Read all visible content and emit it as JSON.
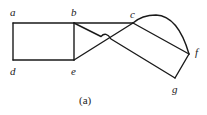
{
  "diagram": {
    "caption": "(a)",
    "nodes": [
      {
        "id": "a",
        "label": "a",
        "x": 13,
        "y": 23
      },
      {
        "id": "b",
        "label": "b",
        "x": 74,
        "y": 23
      },
      {
        "id": "c",
        "label": "c",
        "x": 133,
        "y": 23
      },
      {
        "id": "d",
        "label": "d",
        "x": 13,
        "y": 60
      },
      {
        "id": "e",
        "label": "e",
        "x": 74,
        "y": 60
      },
      {
        "id": "f",
        "label": "f",
        "x": 189,
        "y": 54
      },
      {
        "id": "g",
        "label": "g",
        "x": 175,
        "y": 78
      }
    ],
    "edges": [
      {
        "from": "a",
        "to": "b",
        "type": "line"
      },
      {
        "from": "a",
        "to": "d",
        "type": "line"
      },
      {
        "from": "d",
        "to": "e",
        "type": "line"
      },
      {
        "from": "b",
        "to": "e",
        "type": "line"
      },
      {
        "from": "b",
        "to": "c",
        "type": "line"
      },
      {
        "from": "e",
        "to": "c",
        "type": "line"
      },
      {
        "from": "b",
        "to": "g",
        "type": "line",
        "note": "hops over edge e-c"
      },
      {
        "from": "c",
        "to": "f",
        "type": "line"
      },
      {
        "from": "c",
        "to": "f",
        "type": "arc"
      },
      {
        "from": "f",
        "to": "g",
        "type": "line"
      }
    ]
  }
}
